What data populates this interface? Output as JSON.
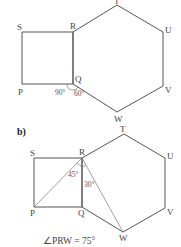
{
  "figure_a": {
    "points": {
      "S": {
        "label": "S",
        "x": 22,
        "y": 32
      },
      "R": {
        "label": "R",
        "x": 73,
        "y": 32
      },
      "Q": {
        "label": "Q",
        "x": 73,
        "y": 84
      },
      "P": {
        "label": "P",
        "x": 22,
        "y": 84
      },
      "T": {
        "label": "T",
        "x": 117,
        "y": 5
      },
      "U": {
        "label": "U",
        "x": 163,
        "y": 32
      },
      "V": {
        "label": "V",
        "x": 163,
        "y": 86
      },
      "W": {
        "label": "W",
        "x": 117,
        "y": 112
      }
    },
    "angles": {
      "square_corner": "90°",
      "hexagon_angle_part": "60°"
    }
  },
  "figure_b": {
    "part_label": "b)",
    "points": {
      "S": {
        "label": "S",
        "x": 34,
        "y": 158
      },
      "R": {
        "label": "R",
        "x": 82,
        "y": 158
      },
      "Q": {
        "label": "Q",
        "x": 82,
        "y": 207
      },
      "P": {
        "label": "P",
        "x": 34,
        "y": 207
      },
      "T": {
        "label": "T",
        "x": 124,
        "y": 134
      },
      "U": {
        "label": "U",
        "x": 165,
        "y": 158
      },
      "V": {
        "label": "V",
        "x": 165,
        "y": 208
      },
      "W": {
        "label": "W",
        "x": 123,
        "y": 232
      }
    },
    "angles": {
      "PRQ": "45°",
      "QRW": "30°"
    },
    "result": "∠PRW = 75°"
  }
}
